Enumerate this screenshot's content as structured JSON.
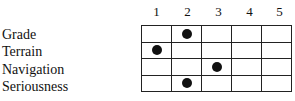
{
  "columns": [
    "1",
    "2",
    "3",
    "4",
    "5"
  ],
  "rows": [
    {
      "label": "Grade",
      "value": 2
    },
    {
      "label": "Terrain",
      "value": 1
    },
    {
      "label": "Navigation",
      "value": 3
    },
    {
      "label": "Seriousness",
      "value": 2
    }
  ]
}
